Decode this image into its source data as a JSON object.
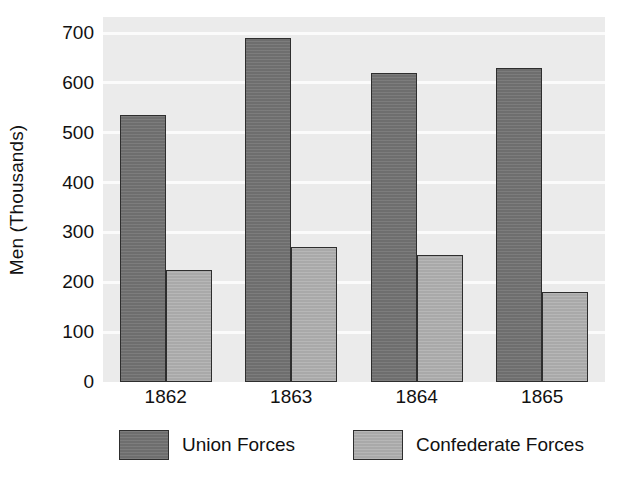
{
  "chart_data": {
    "type": "bar",
    "title": "",
    "xlabel": "",
    "ylabel": "Men (Thousands)",
    "categories": [
      "1862",
      "1863",
      "1864",
      "1865"
    ],
    "series": [
      {
        "name": "Union Forces",
        "color": "#6e6e6e",
        "values": [
          535,
          690,
          620,
          630
        ]
      },
      {
        "name": "Confederate Forces",
        "color": "#a9a9a9",
        "values": [
          225,
          270,
          255,
          180
        ]
      }
    ],
    "ylim": [
      0,
      700
    ],
    "ytick_values": [
      0,
      100,
      200,
      300,
      400,
      500,
      600,
      700
    ],
    "ytick_labels": [
      "0",
      "100",
      "200",
      "300",
      "400",
      "500",
      "600",
      "700"
    ],
    "grid": true,
    "grid_axis": "y",
    "legend_position": "bottom",
    "plot_background_color": "#ebebeb",
    "gridline_color": "#fbfbfb"
  },
  "legend": {
    "items": [
      {
        "label": "Union Forces",
        "swatch": "union-swatch"
      },
      {
        "label": "Confederate Forces",
        "swatch": "confederate-swatch"
      }
    ]
  }
}
